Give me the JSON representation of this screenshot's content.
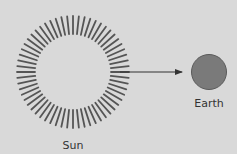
{
  "diagram": {
    "nodes": [
      {
        "id": "sun",
        "label": "Sun",
        "shape": "rayed-circle",
        "cx": 73,
        "cy": 72,
        "inner_radius": 38,
        "outer_radius": 56,
        "ray_count": 60
      },
      {
        "id": "earth",
        "label": "Earth",
        "shape": "circle",
        "cx": 209,
        "cy": 72,
        "radius": 18
      }
    ],
    "edges": [
      {
        "from": "sun",
        "to": "earth",
        "type": "arrow"
      }
    ]
  },
  "labels": {
    "sun": "Sun",
    "earth": "Earth"
  },
  "colors": {
    "background": "#d9d9d9",
    "rays": "#555555",
    "earth_fill": "#7a7a7a",
    "earth_stroke": "#5a5a5a",
    "arrow": "#333333",
    "text": "#333333"
  }
}
